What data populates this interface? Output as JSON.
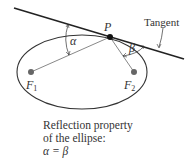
{
  "diagram": {
    "labels": {
      "point": "P",
      "tangent": "Tangent",
      "focus1": "F",
      "focus1_sub": "1",
      "focus2": "F",
      "focus2_sub": "2",
      "alpha": "α",
      "beta": "β"
    },
    "caption": {
      "line1": "Reflection property",
      "line2": "of the ellipse:",
      "line3": "α = β"
    },
    "colors": {
      "line": "#222222",
      "focus": "#666666",
      "text": "#333333"
    }
  }
}
